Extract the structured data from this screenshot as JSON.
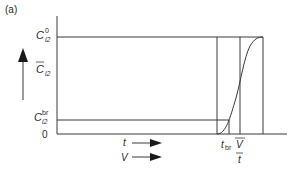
{
  "panel_label": "(a)",
  "y_labels": {
    "c_top": {
      "base": "C",
      "sup": "0",
      "sub": "i2"
    },
    "c_mean": {
      "base": "C",
      "sub": "i2",
      "overbar": true
    },
    "c_br": {
      "base": "C",
      "sup": "br",
      "sub": "i2"
    },
    "zero": "0"
  },
  "x_labels": {
    "t_br": {
      "base": "t",
      "sub": "br"
    },
    "v_over_t": {
      "numerator": "V",
      "denominator": "t",
      "overbar": true
    }
  },
  "x_arrows": [
    {
      "label": "t"
    },
    {
      "label": "V"
    }
  ],
  "colors": {
    "line": "#3a3a3a",
    "text": "#2a2a2a",
    "background": "#ffffff"
  }
}
